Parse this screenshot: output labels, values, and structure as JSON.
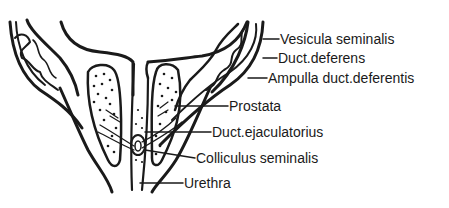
{
  "diagram": {
    "colors": {
      "ink": "#1a1a1a",
      "background": "#ffffff"
    },
    "labels": [
      {
        "id": "vesicula",
        "text": "Vesicula seminalis"
      },
      {
        "id": "deferens",
        "text": "Duct.deferens"
      },
      {
        "id": "ampulla",
        "text": "Ampulla duct.deferentis"
      },
      {
        "id": "prostata",
        "text": "Prostata"
      },
      {
        "id": "ejaculatorius",
        "text": "Duct.ejaculatorius"
      },
      {
        "id": "colliculus",
        "text": "Colliculus seminalis"
      },
      {
        "id": "urethra",
        "text": "Urethra"
      }
    ]
  }
}
